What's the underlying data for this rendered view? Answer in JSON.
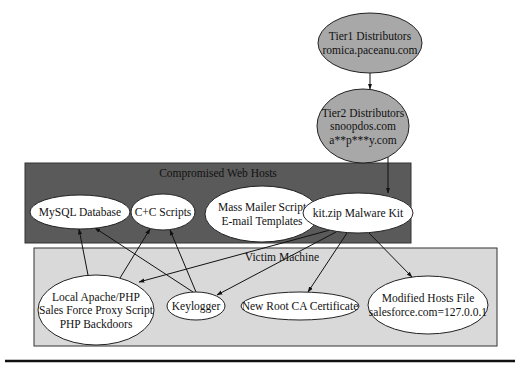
{
  "diagram": {
    "groups": [
      {
        "id": "compromised",
        "label": "Compromised Web Hosts",
        "x": 25,
        "y": 163,
        "w": 386,
        "h": 80,
        "fill": "#5a5a5a",
        "label_x": 218,
        "label_y": 177
      },
      {
        "id": "victim",
        "label": "Victim Machine",
        "x": 34,
        "y": 248,
        "w": 463,
        "h": 98,
        "fill": "#d9d9d9",
        "label_x": 282,
        "label_y": 261
      }
    ],
    "nodes": [
      {
        "id": "tier1",
        "lines": [
          "Tier1 Distributors",
          "romica.paceanu.com"
        ],
        "cx": 370,
        "cy": 43,
        "rx": 52,
        "ry": 30,
        "fill": "#a8a8a8"
      },
      {
        "id": "tier2",
        "lines": [
          "Tier2 Distributors",
          "snoopdos.com",
          "a**p***y.com"
        ],
        "cx": 363,
        "cy": 126,
        "rx": 46,
        "ry": 37,
        "fill": "#a8a8a8"
      },
      {
        "id": "mysql",
        "lines": [
          "MySQL Database"
        ],
        "cx": 80,
        "cy": 212,
        "rx": 50,
        "ry": 17,
        "fill": "#ffffff"
      },
      {
        "id": "cc",
        "lines": [
          "C+C Scripts"
        ],
        "cx": 163,
        "cy": 212,
        "rx": 32,
        "ry": 18,
        "fill": "#ffffff"
      },
      {
        "id": "mailer",
        "lines": [
          "Mass Mailer Script",
          "E-mail Templates"
        ],
        "cx": 262,
        "cy": 214,
        "rx": 57,
        "ry": 28,
        "fill": "#ffffff"
      },
      {
        "id": "kit",
        "lines": [
          "kit.zip Malware Kit"
        ],
        "cx": 358,
        "cy": 213,
        "rx": 55,
        "ry": 20,
        "fill": "#ffffff"
      },
      {
        "id": "apache",
        "lines": [
          "Local Apache/PHP",
          "Sales Force Proxy Script",
          "PHP Backdoors"
        ],
        "cx": 96,
        "cy": 310,
        "rx": 58,
        "ry": 35,
        "fill": "#ffffff"
      },
      {
        "id": "keylogger",
        "lines": [
          "Keylogger"
        ],
        "cx": 196,
        "cy": 306,
        "rx": 29,
        "ry": 14,
        "fill": "#ffffff"
      },
      {
        "id": "rootca",
        "lines": [
          "New Root CA Certificate"
        ],
        "cx": 300,
        "cy": 306,
        "rx": 59,
        "ry": 14,
        "fill": "#ffffff"
      },
      {
        "id": "hosts",
        "lines": [
          "Modified Hosts File",
          "salesforce.com=127.0.0.1"
        ],
        "cx": 428,
        "cy": 305,
        "rx": 60,
        "ry": 29,
        "fill": "#ffffff"
      }
    ],
    "edges": [
      {
        "from": "tier1",
        "to": "tier2",
        "x1": 370,
        "y1": 73,
        "x2": 370,
        "y2": 89
      },
      {
        "from": "tier2",
        "to": "kit",
        "x1": 388,
        "y1": 157,
        "x2": 388,
        "y2": 193
      },
      {
        "from": "kit",
        "to": "apache",
        "x1": 330,
        "y1": 230,
        "x2": 139,
        "y2": 282
      },
      {
        "from": "kit",
        "to": "keylogger",
        "x1": 336,
        "y1": 232,
        "x2": 217,
        "y2": 295
      },
      {
        "from": "kit",
        "to": "rootca",
        "x1": 347,
        "y1": 233,
        "x2": 308,
        "y2": 292
      },
      {
        "from": "kit",
        "to": "hosts",
        "x1": 368,
        "y1": 232,
        "x2": 412,
        "y2": 277
      },
      {
        "from": "apache",
        "to": "mysql",
        "x1": 88,
        "y1": 275,
        "x2": 79,
        "y2": 229
      },
      {
        "from": "apache",
        "to": "cc",
        "x1": 120,
        "y1": 278,
        "x2": 150,
        "y2": 229
      },
      {
        "from": "keylogger",
        "to": "mysql",
        "x1": 193,
        "y1": 292,
        "x2": 95,
        "y2": 228
      },
      {
        "from": "keylogger",
        "to": "cc",
        "x1": 196,
        "y1": 292,
        "x2": 170,
        "y2": 230
      }
    ],
    "footer_rule": {
      "x1": 5,
      "x2": 515,
      "y": 361
    }
  }
}
